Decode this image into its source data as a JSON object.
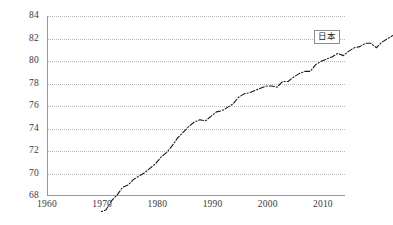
{
  "chart_data": {
    "type": "line",
    "title": "",
    "subtitle": "",
    "xlabel": "",
    "ylabel": "",
    "xlim": [
      1960,
      2014
    ],
    "ylim": [
      68,
      84
    ],
    "grid": "horizontal-dotted",
    "legend_position": "inside-right",
    "legend": [
      "日本"
    ],
    "y_ticks": [
      68,
      70,
      72,
      74,
      76,
      78,
      80,
      82,
      84
    ],
    "x_ticks": [
      1960,
      1970,
      1980,
      1990,
      2000,
      2010
    ],
    "line_style": "dash-dot",
    "line_color": "#1a1a1a",
    "series": [
      {
        "name": "日本",
        "x": [
          1960,
          1961,
          1962,
          1963,
          1964,
          1965,
          1966,
          1967,
          1968,
          1969,
          1970,
          1971,
          1972,
          1973,
          1974,
          1975,
          1976,
          1977,
          1978,
          1979,
          1980,
          1981,
          1982,
          1983,
          1984,
          1985,
          1986,
          1987,
          1988,
          1989,
          1990,
          1991,
          1992,
          1993,
          1994,
          1995,
          1996,
          1997,
          1998,
          1999,
          2000,
          2001,
          2002,
          2003,
          2004,
          2005,
          2006,
          2007,
          2008,
          2009,
          2010,
          2011,
          2012,
          2013,
          2014
        ],
        "values": [
          67.8,
          68.0,
          68.2,
          69.0,
          69.5,
          70.2,
          70.4,
          70.9,
          71.2,
          71.5,
          71.9,
          72.3,
          72.9,
          73.3,
          73.9,
          74.6,
          75.1,
          75.6,
          76.0,
          76.2,
          76.1,
          76.5,
          76.9,
          77.0,
          77.3,
          77.6,
          78.2,
          78.5,
          78.6,
          78.8,
          79.0,
          79.2,
          79.2,
          79.1,
          79.6,
          79.6,
          80.0,
          80.3,
          80.5,
          80.5,
          81.1,
          81.4,
          81.6,
          81.8,
          82.1,
          81.9,
          82.3,
          82.6,
          82.7,
          83.0,
          83.0,
          82.6,
          83.1,
          83.4,
          83.7
        ]
      }
    ]
  },
  "legend_label": "日本",
  "y_axis": {
    "ticks": [
      "68",
      "70",
      "72",
      "74",
      "76",
      "78",
      "80",
      "82",
      "84"
    ]
  },
  "x_axis": {
    "ticks": [
      "1960",
      "1970",
      "1980",
      "1990",
      "2000",
      "2010"
    ]
  }
}
